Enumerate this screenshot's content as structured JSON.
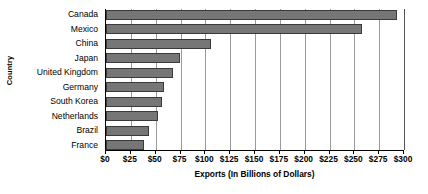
{
  "chart_data": {
    "type": "bar",
    "orientation": "horizontal",
    "title": "",
    "xlabel": "Exports (In Billions of Dollars)",
    "ylabel": "Country",
    "categories": [
      "Canada",
      "Mexico",
      "China",
      "Japan",
      "United Kingdom",
      "Germany",
      "South Korea",
      "Netherlands",
      "Brazil",
      "France"
    ],
    "values": [
      293,
      258,
      106,
      74,
      67,
      58,
      56,
      52,
      43,
      38
    ],
    "xlim": [
      0,
      300
    ],
    "ylim": null,
    "xticks": [
      0,
      25,
      50,
      75,
      100,
      125,
      150,
      175,
      200,
      225,
      250,
      275,
      300
    ],
    "xtick_labels": [
      "$0",
      "$25",
      "$50",
      "$75",
      "$100",
      "$125",
      "$150",
      "$175",
      "$200",
      "$225",
      "$250",
      "$275",
      "$300"
    ],
    "grid": "vertical",
    "legend": null,
    "bar_color": "#767676",
    "bar_edge_color": "#3a3a3a",
    "gridline_color": "#9a9a9a",
    "axis_color": "#000000",
    "background": "#ffffff"
  }
}
